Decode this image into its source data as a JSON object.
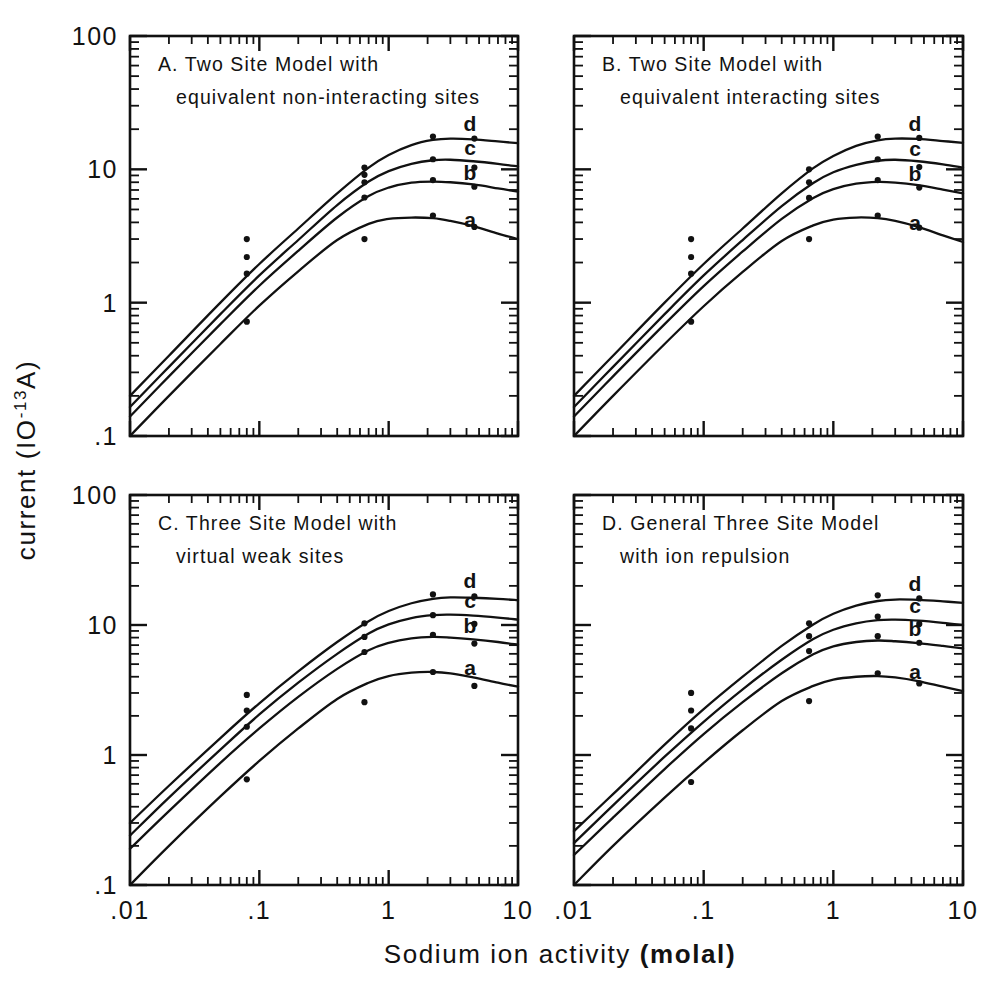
{
  "figure": {
    "x_axis_title_plain": "Sodium ion activity ",
    "x_axis_title_bold": "(molal)",
    "y_axis_title_plain": "current (",
    "y_axis_title_base": "IO",
    "y_axis_title_exp": "-13",
    "y_axis_title_tail": "A)"
  },
  "chart_data": {
    "type": "line",
    "xlabel": "Sodium ion activity (molal)",
    "ylabel": "current (10^-13 A)",
    "xscale": "log",
    "yscale": "log",
    "xlim": [
      0.01,
      10
    ],
    "ylim": [
      0.1,
      100
    ],
    "xticklabels": [
      ".01",
      ".1",
      "1",
      "10"
    ],
    "xtickvalues": [
      0.01,
      0.1,
      1,
      10
    ],
    "yticklabels": [
      "100",
      "10",
      "1",
      ".1"
    ],
    "ytickvalues": [
      100,
      10,
      1,
      0.1
    ],
    "grid": false,
    "legend": "inline-curve-labels",
    "marker": "filled-circle",
    "panels": [
      {
        "id": "A",
        "title_line1": "A. Two Site Model with",
        "title_line2": "equivalent non-interacting sites",
        "series": [
          {
            "name": "d",
            "label": "d",
            "x": [
              0.01,
              0.02,
              0.05,
              0.1,
              0.2,
              0.4,
              0.7,
              1.0,
              1.5,
              2.2,
              3.0,
              4.5,
              7.0,
              10.0
            ],
            "y": [
              0.2,
              0.4,
              1.0,
              1.95,
              3.6,
              6.6,
              10.3,
              12.8,
              15.2,
              16.6,
              17.0,
              16.8,
              16.2,
              15.7
            ],
            "points_x": [
              0.08,
              0.65,
              0.65,
              2.2,
              4.6
            ],
            "points_y": [
              3.0,
              10.3,
              9.1,
              17.6,
              17.0
            ]
          },
          {
            "name": "c",
            "label": "c",
            "x": [
              0.01,
              0.02,
              0.05,
              0.1,
              0.2,
              0.4,
              0.7,
              1.0,
              1.5,
              2.2,
              3.0,
              4.5,
              7.0,
              10.0
            ],
            "y": [
              0.165,
              0.33,
              0.82,
              1.6,
              2.95,
              5.4,
              8.1,
              9.7,
              11.0,
              11.7,
              11.8,
              11.5,
              11.0,
              10.5
            ],
            "points_x": [
              0.08,
              0.65,
              2.2,
              4.6
            ],
            "points_y": [
              2.2,
              8.0,
              11.9,
              10.3
            ]
          },
          {
            "name": "b",
            "label": "b",
            "x": [
              0.01,
              0.02,
              0.05,
              0.1,
              0.2,
              0.4,
              0.7,
              1.0,
              1.5,
              2.2,
              3.0,
              4.5,
              7.0,
              10.0
            ],
            "y": [
              0.14,
              0.28,
              0.69,
              1.34,
              2.45,
              4.35,
              6.3,
              7.3,
              7.95,
              8.1,
              8.0,
              7.7,
              7.2,
              6.8
            ],
            "points_x": [
              0.08,
              0.65,
              2.2,
              4.6
            ],
            "points_y": [
              1.65,
              6.15,
              8.3,
              7.4
            ]
          },
          {
            "name": "a",
            "label": "a",
            "x": [
              0.01,
              0.02,
              0.05,
              0.1,
              0.2,
              0.4,
              0.7,
              1.0,
              1.5,
              2.2,
              3.0,
              4.5,
              7.0,
              10.0
            ],
            "y": [
              0.1,
              0.2,
              0.49,
              0.95,
              1.72,
              2.95,
              3.9,
              4.25,
              4.35,
              4.3,
              4.1,
              3.75,
              3.3,
              3.0
            ],
            "points_x": [
              0.08,
              0.65,
              2.2,
              4.6
            ],
            "points_y": [
              0.72,
              3.0,
              4.5,
              3.7
            ]
          }
        ]
      },
      {
        "id": "B",
        "title_line1": "B. Two Site Model with",
        "title_line2": "equivalent interacting sites",
        "series": [
          {
            "name": "d",
            "label": "d",
            "x": [
              0.01,
              0.02,
              0.05,
              0.1,
              0.2,
              0.4,
              0.7,
              1.0,
              1.5,
              2.2,
              3.0,
              4.5,
              7.0,
              10.0
            ],
            "y": [
              0.2,
              0.4,
              1.0,
              1.95,
              3.6,
              6.6,
              10.2,
              12.6,
              15.0,
              16.5,
              17.0,
              16.9,
              16.3,
              15.8
            ],
            "points_x": [
              0.08,
              0.65,
              2.2,
              4.6
            ],
            "points_y": [
              3.0,
              10.0,
              17.6,
              17.2
            ]
          },
          {
            "name": "c",
            "label": "c",
            "x": [
              0.01,
              0.02,
              0.05,
              0.1,
              0.2,
              0.4,
              0.7,
              1.0,
              1.5,
              2.2,
              3.0,
              4.5,
              7.0,
              10.0
            ],
            "y": [
              0.165,
              0.33,
              0.82,
              1.6,
              2.95,
              5.3,
              7.9,
              9.5,
              10.8,
              11.6,
              11.8,
              11.5,
              10.9,
              10.3
            ],
            "points_x": [
              0.08,
              0.65,
              2.2,
              4.6
            ],
            "points_y": [
              2.2,
              8.0,
              11.9,
              10.4
            ]
          },
          {
            "name": "b",
            "label": "b",
            "x": [
              0.01,
              0.02,
              0.05,
              0.1,
              0.2,
              0.4,
              0.7,
              1.0,
              1.5,
              2.2,
              3.0,
              4.5,
              7.0,
              10.0
            ],
            "y": [
              0.14,
              0.28,
              0.69,
              1.33,
              2.42,
              4.25,
              6.1,
              7.1,
              7.8,
              8.05,
              7.95,
              7.6,
              7.05,
              6.6
            ],
            "points_x": [
              0.08,
              0.65,
              2.2,
              4.6
            ],
            "points_y": [
              1.65,
              6.1,
              8.3,
              7.3
            ]
          },
          {
            "name": "a",
            "label": "a",
            "x": [
              0.01,
              0.02,
              0.05,
              0.1,
              0.2,
              0.4,
              0.7,
              1.0,
              1.5,
              2.2,
              3.0,
              4.5,
              7.0,
              10.0
            ],
            "y": [
              0.1,
              0.2,
              0.49,
              0.94,
              1.7,
              2.9,
              3.8,
              4.2,
              4.35,
              4.3,
              4.1,
              3.7,
              3.2,
              2.85
            ],
            "points_x": [
              0.08,
              0.65,
              2.2,
              4.6
            ],
            "points_y": [
              0.72,
              3.0,
              4.5,
              3.65
            ]
          }
        ]
      },
      {
        "id": "C",
        "title_line1": "C. Three Site Model with",
        "title_line2": "virtual weak sites",
        "series": [
          {
            "name": "d",
            "label": "d",
            "x": [
              0.01,
              0.02,
              0.05,
              0.1,
              0.2,
              0.4,
              0.7,
              1.0,
              1.5,
              2.2,
              3.0,
              4.5,
              7.0,
              10.0
            ],
            "y": [
              0.3,
              0.58,
              1.35,
              2.5,
              4.4,
              7.4,
              10.7,
              12.8,
              14.7,
              15.9,
              16.3,
              16.2,
              15.9,
              15.5
            ],
            "points_x": [
              0.08,
              0.65,
              2.2,
              4.6
            ],
            "points_y": [
              2.9,
              10.3,
              17.2,
              16.6
            ]
          },
          {
            "name": "c",
            "label": "c",
            "x": [
              0.01,
              0.02,
              0.05,
              0.1,
              0.2,
              0.4,
              0.7,
              1.0,
              1.5,
              2.2,
              3.0,
              4.5,
              7.0,
              10.0
            ],
            "y": [
              0.24,
              0.47,
              1.1,
              2.05,
              3.6,
              6.0,
              8.6,
              10.1,
              11.3,
              11.9,
              12.0,
              11.8,
              11.4,
              11.0
            ],
            "points_x": [
              0.08,
              0.65,
              2.2,
              4.6
            ],
            "points_y": [
              2.2,
              8.1,
              11.9,
              10.2
            ]
          },
          {
            "name": "b",
            "label": "b",
            "x": [
              0.01,
              0.02,
              0.05,
              0.1,
              0.2,
              0.4,
              0.7,
              1.0,
              1.5,
              2.2,
              3.0,
              4.5,
              7.0,
              10.0
            ],
            "y": [
              0.19,
              0.37,
              0.87,
              1.6,
              2.8,
              4.6,
              6.4,
              7.3,
              7.9,
              8.1,
              8.0,
              7.75,
              7.4,
              7.05
            ],
            "points_x": [
              0.08,
              0.65,
              2.2,
              4.6
            ],
            "points_y": [
              1.65,
              6.2,
              8.4,
              7.2
            ]
          },
          {
            "name": "a",
            "label": "a",
            "x": [
              0.01,
              0.02,
              0.05,
              0.1,
              0.2,
              0.4,
              0.7,
              1.0,
              1.5,
              2.2,
              3.0,
              4.5,
              7.0,
              10.0
            ],
            "y": [
              0.1,
              0.2,
              0.48,
              0.9,
              1.6,
              2.7,
              3.6,
              4.05,
              4.3,
              4.35,
              4.25,
              3.95,
              3.6,
              3.35
            ],
            "points_x": [
              0.08,
              0.65,
              2.2,
              4.6
            ],
            "points_y": [
              0.65,
              2.55,
              4.35,
              3.4
            ]
          }
        ]
      },
      {
        "id": "D",
        "title_line1": "D. General Three Site Model",
        "title_line2": "with ion repulsion",
        "series": [
          {
            "name": "d",
            "label": "d",
            "x": [
              0.01,
              0.02,
              0.05,
              0.1,
              0.2,
              0.4,
              0.7,
              1.0,
              1.5,
              2.2,
              3.0,
              4.5,
              7.0,
              10.0
            ],
            "y": [
              0.26,
              0.5,
              1.2,
              2.25,
              4.0,
              6.9,
              10.1,
              12.2,
              14.1,
              15.3,
              15.7,
              15.6,
              15.2,
              14.8
            ],
            "points_x": [
              0.08,
              0.65,
              2.2,
              4.6
            ],
            "points_y": [
              3.0,
              10.3,
              16.9,
              16.0
            ]
          },
          {
            "name": "c",
            "label": "c",
            "x": [
              0.01,
              0.02,
              0.05,
              0.1,
              0.2,
              0.4,
              0.7,
              1.0,
              1.5,
              2.2,
              3.0,
              4.5,
              7.0,
              10.0
            ],
            "y": [
              0.21,
              0.41,
              0.97,
              1.8,
              3.2,
              5.4,
              7.8,
              9.2,
              10.3,
              10.9,
              11.0,
              10.8,
              10.4,
              10.0
            ],
            "points_x": [
              0.08,
              0.65,
              2.2,
              4.6
            ],
            "points_y": [
              2.2,
              8.2,
              11.6,
              10.2
            ]
          },
          {
            "name": "b",
            "label": "b",
            "x": [
              0.01,
              0.02,
              0.05,
              0.1,
              0.2,
              0.4,
              0.7,
              1.0,
              1.5,
              2.2,
              3.0,
              4.5,
              7.0,
              10.0
            ],
            "y": [
              0.17,
              0.33,
              0.78,
              1.45,
              2.55,
              4.25,
              5.95,
              6.85,
              7.4,
              7.6,
              7.5,
              7.25,
              6.9,
              6.6
            ],
            "points_x": [
              0.08,
              0.65,
              2.2,
              4.6
            ],
            "points_y": [
              1.6,
              6.3,
              8.2,
              7.3
            ]
          },
          {
            "name": "a",
            "label": "a",
            "x": [
              0.01,
              0.02,
              0.05,
              0.1,
              0.2,
              0.4,
              0.7,
              1.0,
              1.5,
              2.2,
              3.0,
              4.5,
              7.0,
              10.0
            ],
            "y": [
              0.1,
              0.2,
              0.47,
              0.87,
              1.55,
              2.6,
              3.4,
              3.8,
              4.0,
              4.05,
              3.95,
              3.7,
              3.35,
              3.1
            ],
            "points_x": [
              0.08,
              0.65,
              2.2,
              4.6
            ],
            "points_y": [
              0.62,
              2.6,
              4.25,
              3.55
            ]
          }
        ]
      }
    ]
  }
}
